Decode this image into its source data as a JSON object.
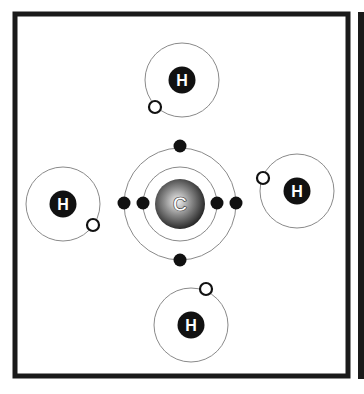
{
  "diagram": {
    "carbon": {
      "symbol": "C",
      "cx": 180,
      "cy": 204,
      "nucleus_r": 25,
      "inner_orbit_r": 37,
      "outer_orbit_r": 56,
      "electrons": [
        {
          "x": 143,
          "y": 203,
          "shell": "inner"
        },
        {
          "x": 217,
          "y": 203,
          "shell": "inner"
        },
        {
          "x": 124,
          "y": 203,
          "shell": "outer"
        },
        {
          "x": 236,
          "y": 203,
          "shell": "outer"
        },
        {
          "x": 180,
          "y": 146,
          "shell": "outer"
        },
        {
          "x": 180,
          "y": 260,
          "shell": "outer"
        }
      ]
    },
    "hydrogens": [
      {
        "id": "top",
        "symbol": "H",
        "cx": 182,
        "cy": 80,
        "orbit_r": 37,
        "electron": {
          "x": 155,
          "y": 107
        }
      },
      {
        "id": "left",
        "symbol": "H",
        "cx": 63,
        "cy": 204,
        "orbit_r": 37,
        "electron": {
          "x": 93,
          "y": 225
        }
      },
      {
        "id": "right",
        "symbol": "H",
        "cx": 297,
        "cy": 191,
        "orbit_r": 37,
        "electron": {
          "x": 263,
          "y": 178
        }
      },
      {
        "id": "bottom",
        "symbol": "H",
        "cx": 191,
        "cy": 325,
        "orbit_r": 37,
        "electron": {
          "x": 206,
          "y": 289
        }
      }
    ],
    "colors": {
      "frame": "#1a1a1a",
      "orbit": "#8a8a8a",
      "electron_filled": "#111111",
      "nucleus_h": "#111111",
      "label": "#ffffff"
    }
  }
}
